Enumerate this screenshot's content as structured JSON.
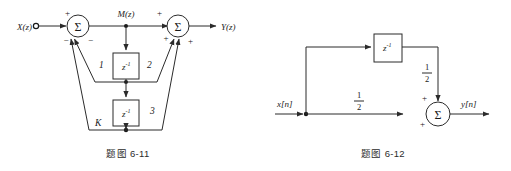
{
  "page": {
    "width": 511,
    "height": 171,
    "background": "#ffffff",
    "ink": "#2b2b2b"
  },
  "figures": [
    {
      "id": "fig-6-11",
      "caption": "题图 6-11",
      "input_label": "X(z)",
      "output_label": "Y(z)",
      "intermediate_label": "M(z)",
      "summers": [
        {
          "id": "summer-left",
          "glyph": "Σ",
          "signs": [
            "+",
            "−",
            "−"
          ]
        },
        {
          "id": "summer-right",
          "glyph": "Σ",
          "signs": [
            "+",
            "+",
            "+"
          ]
        }
      ],
      "delay_blocks": [
        {
          "id": "delay-1",
          "base": "z",
          "exponent": "-1"
        },
        {
          "id": "delay-2",
          "base": "z",
          "exponent": "-1"
        }
      ],
      "branch_labels": [
        "1",
        "2",
        "3",
        "K"
      ]
    },
    {
      "id": "fig-6-12",
      "caption": "题图 6-12",
      "input_label": "x[n]",
      "output_label": "y[n]",
      "summers": [
        {
          "id": "summer-out",
          "glyph": "Σ",
          "signs": [
            "+",
            "+"
          ]
        }
      ],
      "delay_blocks": [
        {
          "id": "delay-1",
          "base": "z",
          "exponent": "-1"
        }
      ],
      "gain_labels": [
        {
          "id": "gain-feedforward",
          "numerator": "1",
          "denominator": "2"
        },
        {
          "id": "gain-delay",
          "numerator": "1",
          "denominator": "2"
        }
      ]
    }
  ]
}
